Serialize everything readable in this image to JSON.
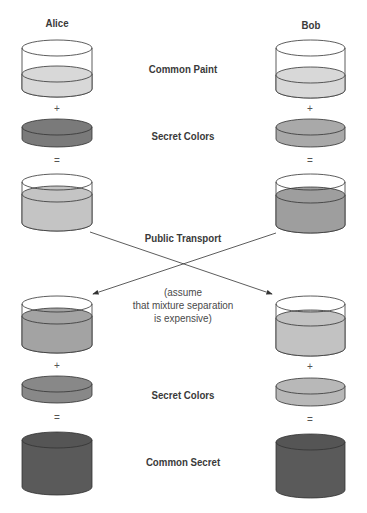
{
  "title_partial": "",
  "parties": {
    "left": "Alice",
    "right": "Bob"
  },
  "rows": {
    "common_paint": "Common Paint",
    "secret_colors_1": "Secret Colors",
    "public_transport": "Public Transport",
    "note": [
      "(assume",
      "that mixture separation",
      "is expensive)"
    ],
    "secret_colors_2": "Secret Colors",
    "common_secret": "Common Secret"
  },
  "operators": {
    "plus": "+",
    "equals": "="
  },
  "colors": {
    "common_paint": "#d8d8d8",
    "alice_secret": "#7a7a7a",
    "bob_secret": "#a9a9a9",
    "alice_mix": "#c4c4c4",
    "bob_mix": "#9e9e9e",
    "alice_received": "#a3a3a3",
    "bob_received": "#c2c2c2",
    "common_secret": "#5a5a5a",
    "outline": "#333333"
  }
}
